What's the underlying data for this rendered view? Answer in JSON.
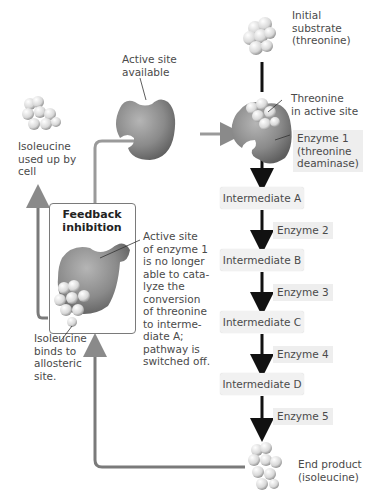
{
  "labels": {
    "initial_substrate": "Initial\nsubstrate\n(threonine)",
    "threonine_active_site": "Threonine\nin active site",
    "enzyme1": "Enzyme 1\n(threonine\ndeaminase)",
    "active_site_available": "Active site\navailable",
    "isoleucine_used_up": "Isoleucine\nused up by\ncell",
    "feedback_title": "Feedback\ninhibition",
    "active_site_no_longer": "Active site\nof enzyme 1\nis no longer\nable to cata-\nlyze the\nconversion\nof threonine\nto interme-\ndiate A;\npathway is\nswitched off.",
    "isoleucine_binds": "Isoleucine\nbinds to\nallosteric\nsite.",
    "end_product": "End product\n(isoleucine)"
  },
  "pathway": {
    "intermediates": [
      "Intermediate A",
      "Intermediate B",
      "Intermediate C",
      "Intermediate D"
    ],
    "enzymes": [
      "Enzyme 2",
      "Enzyme 3",
      "Enzyme 4",
      "Enzyme 5"
    ]
  },
  "colors": {
    "enzyme_gray": "#8a8a8a",
    "feedback_arrow": "#7a7a7a",
    "pathway_arrow": "#111111",
    "label_bg": "#eeeeee"
  }
}
